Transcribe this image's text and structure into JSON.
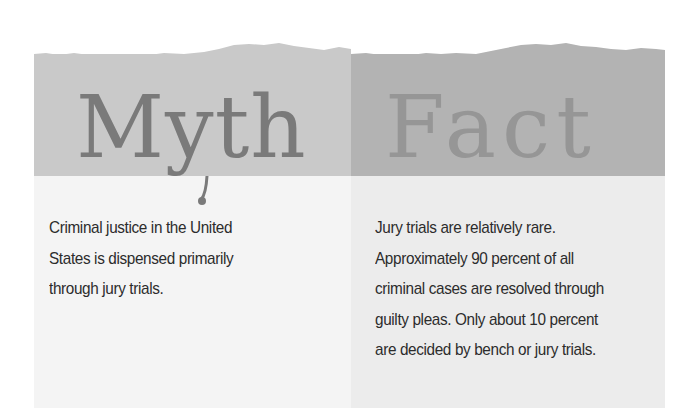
{
  "myth": {
    "title": "Myth",
    "lines": [
      "Criminal justice in the United",
      "States is dispensed primarily",
      "through jury trials."
    ]
  },
  "fact": {
    "title": "Fact",
    "lines": [
      "Jury trials are relatively rare.",
      "Approximately 90 percent of all",
      "criminal cases are resolved through",
      "guilty pleas. Only about 10 percent",
      "are decided by bench or jury trials."
    ]
  },
  "colors": {
    "myth_header": "#c9c9c9",
    "fact_header": "#b3b3b3",
    "myth_body": "#f4f4f4",
    "fact_body": "#ececec",
    "text": "#2c2c2c"
  }
}
